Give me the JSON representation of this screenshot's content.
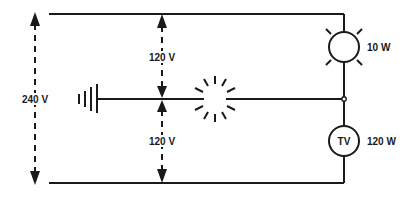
{
  "diagram": {
    "type": "circuit",
    "labels": {
      "total_voltage": "240 V",
      "upper_voltage": "120 V",
      "lower_voltage": "120 V",
      "lamp_power": "10 W",
      "tv_label": "TV",
      "tv_power": "120 W"
    },
    "components": [
      {
        "id": "lamp",
        "kind": "lamp",
        "power": "10 W"
      },
      {
        "id": "tv",
        "kind": "load",
        "label": "TV",
        "power": "120 W"
      },
      {
        "id": "ground",
        "kind": "ground"
      },
      {
        "id": "spark",
        "kind": "spark/flash"
      }
    ],
    "colors": {
      "line": "#1a1a1a",
      "background": "#ffffff"
    }
  }
}
